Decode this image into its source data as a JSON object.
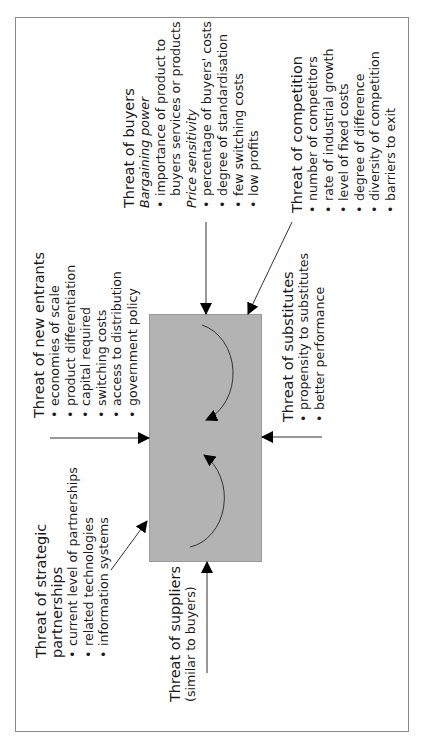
{
  "diagram": {
    "center_box": {
      "fill": "#b3b3b3",
      "label": ""
    },
    "forces": {
      "buyers": {
        "title": "Threat of buyers",
        "groups": [
          {
            "heading": "Bargaining power",
            "items": [
              "importance of product to",
              "buyers services or products"
            ]
          },
          {
            "heading": "Price sensitivity",
            "items": [
              "percentage of buyers' costs",
              "degree of standardisation",
              "few switching costs",
              "low profits"
            ]
          }
        ]
      },
      "competition": {
        "title": "Threat of competition",
        "items": [
          "number of competitors",
          "rate of industrial growth",
          "level of fixed costs",
          "degree of difference",
          "diversity of competition",
          "barriers to exit"
        ]
      },
      "new_entrants": {
        "title": "Threat of new entrants",
        "items": [
          "economies of scale",
          "product differentiation",
          "capital required",
          "switching costs",
          "access to distribution",
          "government policy"
        ]
      },
      "substitutes": {
        "title": "Threat of substitutes",
        "items": [
          "propensity to substitutes",
          "better performance"
        ]
      },
      "strategic_partnerships": {
        "title_line1": "Threat of strategic",
        "title_line2": "partnerships",
        "items": [
          "current level of partnerships",
          "related technologies",
          "information systems"
        ]
      },
      "suppliers": {
        "title": "Threat of suppliers",
        "subtitle": "(similar to buyers)"
      }
    }
  }
}
